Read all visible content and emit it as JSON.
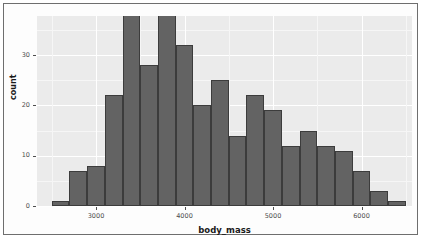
{
  "figure": {
    "background_color": "#ffffff",
    "panel_color": "#ebebeb",
    "frame_color": "#6e6e6e"
  },
  "axes": {
    "x_title": "body_mass",
    "y_title": "count",
    "x_ticks": [
      {
        "label": "3000",
        "value": 3000
      },
      {
        "label": "4000",
        "value": 4000
      },
      {
        "label": "5000",
        "value": 5000
      },
      {
        "label": "6000",
        "value": 6000
      }
    ],
    "y_ticks": [
      {
        "label": "0",
        "value": 0
      },
      {
        "label": "10",
        "value": 10
      },
      {
        "label": "20",
        "value": 20
      },
      {
        "label": "30",
        "value": 30
      }
    ]
  },
  "chart_data": {
    "type": "bar",
    "title": "",
    "subtitle": "",
    "xlabel": "body_mass",
    "ylabel": "count",
    "xlim": [
      2500,
      6500
    ],
    "ylim": [
      0,
      38
    ],
    "grid": true,
    "legend": "none",
    "bar_fill_color": "#636363",
    "bar_border_color": "#3c3c3c",
    "bin_width": 200,
    "bin_starts": [
      2500,
      2700,
      2900,
      3100,
      3300,
      3500,
      3700,
      3900,
      4100,
      4300,
      4500,
      4700,
      4900,
      5100,
      5300,
      5500,
      5700,
      5900,
      6100,
      6300
    ],
    "bin_centers": [
      2600,
      2800,
      3000,
      3200,
      3400,
      3600,
      3800,
      4000,
      4200,
      4400,
      4600,
      4800,
      5000,
      5200,
      5400,
      5600,
      5800,
      6000,
      6200,
      6400
    ],
    "categories": [
      "2500-2700",
      "2700-2900",
      "2900-3100",
      "3100-3300",
      "3300-3500",
      "3500-3700",
      "3700-3900",
      "3900-4100",
      "4100-4300",
      "4300-4500",
      "4500-4700",
      "4700-4900",
      "4900-5100",
      "5100-5300",
      "5300-5500",
      "5500-5700",
      "5700-5900",
      "5900-6100",
      "6100-6300",
      "6300-6500"
    ],
    "values": [
      1,
      7,
      8,
      22,
      38,
      28,
      38,
      32,
      20,
      25,
      14,
      22,
      19,
      12,
      15,
      12,
      11,
      7,
      3,
      1
    ]
  }
}
